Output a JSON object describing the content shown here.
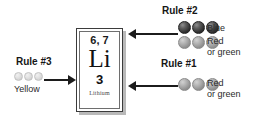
{
  "diagram": {
    "element": {
      "mass_numbers": "6, 7",
      "symbol": "Li",
      "atomic_number": "3",
      "name": "Lithium"
    },
    "rules": [
      {
        "id": "rule-3",
        "title": "Rule #3",
        "position": "left",
        "arrow_direction": "right",
        "arrow_target": "atomic-number",
        "swatch_rows": [
          {
            "label": "Yellow",
            "sphere_count": 3,
            "sphere_tone": "light",
            "sphere_size": "small",
            "color_hex": "#e2e2e2"
          }
        ]
      },
      {
        "id": "rule-2",
        "title": "Rule #2",
        "position": "top-right",
        "arrow_direction": "left",
        "arrow_target": "mass-numbers",
        "swatch_rows": [
          {
            "label": "Blue",
            "label_line_2": "",
            "sphere_count": 3,
            "sphere_tone": "dark",
            "sphere_size": "big",
            "color_hex": "#2e2e2e"
          },
          {
            "label": "Red",
            "label_line_2": "or green",
            "sphere_count": 3,
            "sphere_tone": "mid",
            "sphere_size": "big",
            "color_hex": "#b5b5b5"
          }
        ]
      },
      {
        "id": "rule-1",
        "title": "Rule #1",
        "position": "bottom-right",
        "arrow_direction": "left",
        "arrow_target": "atomic-number",
        "swatch_rows": [
          {
            "label": "Red",
            "label_line_2": "or green",
            "sphere_count": 3,
            "sphere_tone": "mid",
            "sphere_size": "big",
            "color_hex": "#b5b5b5"
          }
        ]
      }
    ]
  }
}
